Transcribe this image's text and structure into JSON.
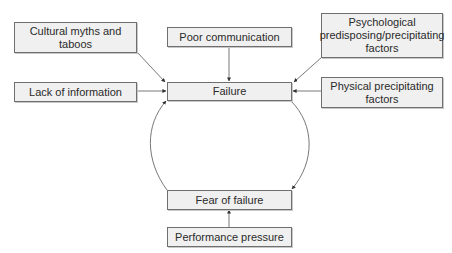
{
  "diagram": {
    "type": "causal-flow",
    "central_node": "Failure",
    "nodes": {
      "cultural": {
        "label": "Cultural myths and taboos"
      },
      "poor_comm": {
        "label": "Poor communication"
      },
      "psychological": {
        "label": "Psychological predisposing/precipitating factors"
      },
      "lack_info": {
        "label": "Lack of information"
      },
      "failure": {
        "label": "Failure"
      },
      "physical": {
        "label": "Physical precipitating factors"
      },
      "fear": {
        "label": "Fear of failure"
      },
      "performance": {
        "label": "Performance pressure"
      }
    },
    "edges": [
      {
        "from": "Cultural myths and taboos",
        "to": "Failure"
      },
      {
        "from": "Poor communication",
        "to": "Failure"
      },
      {
        "from": "Psychological predisposing/precipitating factors",
        "to": "Failure"
      },
      {
        "from": "Lack of information",
        "to": "Failure"
      },
      {
        "from": "Physical precipitating factors",
        "to": "Failure"
      },
      {
        "from": "Fear of failure",
        "to": "Failure",
        "style": "curved"
      },
      {
        "from": "Failure",
        "to": "Fear of failure",
        "style": "curved"
      },
      {
        "from": "Performance pressure",
        "to": "Fear of failure"
      }
    ],
    "colors": {
      "box_fill": "#f0f0f0",
      "box_border": "#6f6f6f",
      "line": "#444444",
      "text": "#2a2a2a"
    }
  }
}
